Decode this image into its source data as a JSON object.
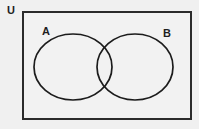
{
  "canvas": {
    "width": 199,
    "height": 129,
    "background_color": "#f0f0f0"
  },
  "diagram": {
    "kind": "venn-diagram",
    "set_count": 2,
    "shading": "none",
    "universe": {
      "label": "U",
      "label_x": 11,
      "label_y": 11,
      "rect": {
        "x": 22,
        "y": 11,
        "width": 170,
        "height": 109
      },
      "fill_color": "#f2f2f2",
      "stroke_color": "#2b2b2b",
      "stroke_width": 2
    },
    "sets": [
      {
        "label": "A",
        "label_x": 46,
        "label_y": 32,
        "cx": 73,
        "cy": 67,
        "rx": 39,
        "ry": 33,
        "fill": "none",
        "stroke_color": "#1c1c1c",
        "stroke_width": 1.7
      },
      {
        "label": "B",
        "label_x": 167,
        "label_y": 34,
        "cx": 135,
        "cy": 67,
        "rx": 38,
        "ry": 33,
        "fill": "none",
        "stroke_color": "#1c1c1c",
        "stroke_width": 1.7
      }
    ],
    "intersection": {
      "upper_crossing": {
        "x": 104,
        "y": 48
      },
      "lower_crossing": {
        "x": 104,
        "y": 85
      },
      "shaded": false
    }
  }
}
